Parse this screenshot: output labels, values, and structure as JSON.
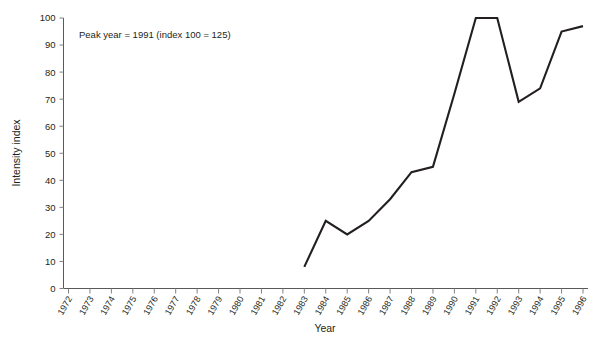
{
  "chart_data": {
    "type": "line",
    "title": "",
    "xlabel": "Year",
    "ylabel": "Intensity index",
    "xlim": [
      1972,
      1996
    ],
    "ylim": [
      0,
      100
    ],
    "grid": false,
    "legend": null,
    "annotations": [
      {
        "text": "Peak year = 1991 (index 100 = 125)",
        "x": 1974,
        "y": 95
      }
    ],
    "categories": [
      "1972",
      "1973",
      "1974",
      "1975",
      "1976",
      "1977",
      "1978",
      "1979",
      "1980",
      "1981",
      "1982",
      "1983",
      "1984",
      "1985",
      "1986",
      "1987",
      "1988",
      "1989",
      "1990",
      "1991",
      "1992",
      "1993",
      "1994",
      "1995",
      "1996"
    ],
    "yticks": [
      0,
      10,
      20,
      30,
      40,
      50,
      60,
      70,
      80,
      90,
      100
    ],
    "series": [
      {
        "name": "Intensity index",
        "x": [
          1983,
          1984,
          1985,
          1986,
          1987,
          1988,
          1989,
          1990,
          1991,
          1992,
          1993,
          1994,
          1995,
          1996
        ],
        "values": [
          8,
          25,
          20,
          25,
          33,
          43,
          45,
          72,
          100,
          100,
          69,
          74,
          95,
          97
        ]
      }
    ],
    "colors": {
      "line": "#231f20",
      "axis": "#58595b",
      "text": "#231f20",
      "background": "#ffffff"
    }
  }
}
